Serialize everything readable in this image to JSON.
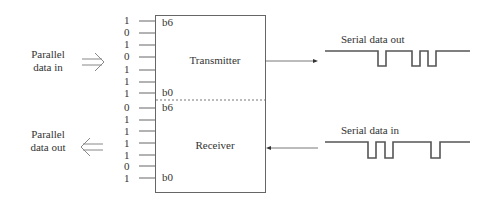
{
  "diagram": {
    "left": {
      "parallel_in_label": [
        "Parallel",
        "data in"
      ],
      "parallel_out_label": [
        "Parallel",
        "data out"
      ],
      "transmitter_bits": [
        "1",
        "0",
        "1",
        "0",
        "1",
        "1",
        "1"
      ],
      "receiver_bits": [
        "0",
        "1",
        "1",
        "1",
        "1",
        "0",
        "1"
      ]
    },
    "box": {
      "transmitter_label": "Transmitter",
      "receiver_label": "Receiver",
      "tx_top_pin": "b6",
      "tx_bottom_pin": "b0",
      "rx_top_pin": "b6",
      "rx_bottom_pin": "b0"
    },
    "right": {
      "serial_out_label": "Serial data out",
      "serial_in_label": "Serial data in"
    },
    "colors": {
      "line": "#555555",
      "waveform": "#555555",
      "text": "#333333"
    }
  }
}
